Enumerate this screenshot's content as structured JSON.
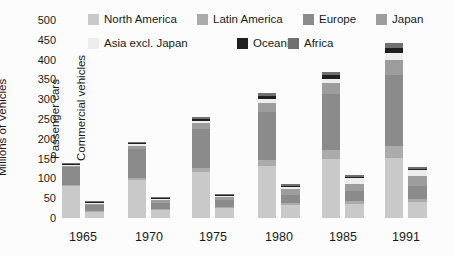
{
  "y_axis": {
    "label": "Millions of Vehicles",
    "ticks": [
      0,
      50,
      100,
      150,
      200,
      250,
      300,
      350,
      400,
      450,
      500
    ]
  },
  "bar_annotations": {
    "passenger": "Passenger cars",
    "commercial": "Commercial vehicles"
  },
  "chart_data": {
    "type": "bar",
    "stacked": true,
    "grouped": true,
    "title": "",
    "xlabel": "",
    "ylabel": "Millions of Vehicles",
    "ylim": [
      0,
      500
    ],
    "grid": false,
    "legend_position": "top",
    "categories": [
      "1965",
      "1970",
      "1975",
      "1980",
      "1985",
      "1991"
    ],
    "bars_per_category": [
      "Passenger cars",
      "Commercial vehicles"
    ],
    "series": [
      {
        "name": "North America",
        "color": "#c9c9c9",
        "passenger": [
          80,
          96,
          117,
          131,
          150,
          151
        ],
        "commercial": [
          16,
          20,
          26,
          33,
          36,
          40
        ]
      },
      {
        "name": "Latin America",
        "color": "#ababab",
        "passenger": [
          4,
          6,
          9,
          15,
          21,
          30
        ],
        "commercial": [
          2,
          3,
          3,
          5,
          6,
          7
        ]
      },
      {
        "name": "Europe",
        "color": "#8b8b8b",
        "passenger": [
          45,
          72,
          98,
          121,
          143,
          180
        ],
        "commercial": [
          14,
          16,
          16,
          21,
          26,
          34
        ]
      },
      {
        "name": "Japan",
        "color": "#9d9d9d",
        "passenger": [
          2,
          9,
          17,
          23,
          27,
          37
        ],
        "commercial": [
          4,
          7,
          9,
          14,
          18,
          25
        ]
      },
      {
        "name": "Asia excl. Japan",
        "color": "#ededed",
        "passenger": [
          2,
          3,
          5,
          10,
          10,
          19
        ],
        "commercial": [
          2,
          2,
          2,
          6,
          14,
          14
        ]
      },
      {
        "name": "Oceania",
        "color": "#1f1f1f",
        "passenger": [
          4,
          4,
          5,
          8,
          9,
          13
        ],
        "commercial": [
          2,
          2,
          2,
          3,
          4,
          4
        ]
      },
      {
        "name": "Africa",
        "color": "#707070",
        "passenger": [
          3,
          3,
          4,
          8,
          8,
          12
        ],
        "commercial": [
          2,
          2,
          2,
          3,
          4,
          4
        ]
      }
    ]
  }
}
